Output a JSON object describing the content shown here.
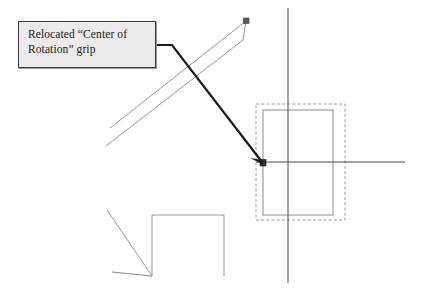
{
  "diagram": {
    "background_color": "#ffffff",
    "width": 422,
    "height": 296,
    "annotation": {
      "text": "Relocated “Center of\nRotation” grip",
      "fill_color": "#eceaea",
      "border_color": "#3a3a3a",
      "text_color": "#1a1a1a",
      "x": 18,
      "y": 21,
      "width": 138,
      "height": 47
    },
    "leader": {
      "name": "leader-arrow",
      "color": "#1a1a1a",
      "stroke_width": 2.2,
      "points": "156,45 172,45 263,163",
      "arrow_target_x": 263,
      "arrow_target_y": 163
    },
    "shapes": {
      "rotated_rectangle": {
        "label": "rotated rectangle object",
        "color": "#8a8a8a",
        "stroke_width": 0.9,
        "edge_top": "110,128 246,21",
        "edge_bottom": "106,146 243,40",
        "edge_cap": "246,21 243,40",
        "grip_x": 246,
        "grip_y": 21,
        "grip_color": "#555555"
      },
      "selection_rectangle": {
        "label": "selected rectangle with dashed highlight",
        "dashed_color": "#9a9a9a",
        "solid_color": "#8a8a8a",
        "dashed_x": 256,
        "dashed_y": 104,
        "dashed_width": 89,
        "dashed_height": 116,
        "solid_x": 263,
        "solid_y": 110,
        "solid_width": 70,
        "solid_height": 105
      },
      "crosshair": {
        "label": "center of rotation crosshair axes",
        "color": "#4a4a4a",
        "vertical_x": 288,
        "vertical_y1": 8,
        "vertical_y2": 283,
        "horizontal_y": 162,
        "horizontal_x1": 256,
        "horizontal_x2": 405
      },
      "center_grip": {
        "label": "center of rotation grip marker",
        "x": 263,
        "y": 163,
        "size": 6,
        "color": "#333333"
      },
      "corner_shape": {
        "label": "partial rectangle with vertex lines",
        "color": "#8a8a8a",
        "rect_top": "152,215 224,215",
        "rect_right": "224,215 224,276",
        "rect_left": "152,215 152,276",
        "diagonal_line": "107,210 152,276",
        "horizontal_line": "112,272 152,276"
      }
    }
  }
}
